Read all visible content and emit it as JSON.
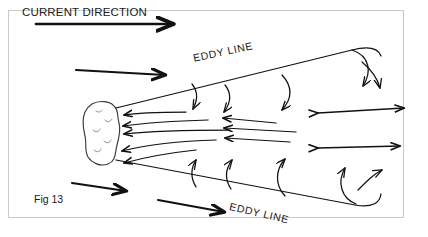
{
  "figure": {
    "width": 428,
    "height": 237,
    "background": "#ffffff",
    "frame_color": "#c9c9c9",
    "ink_color": "#111111",
    "title_label": "CURRENT DIRECTION",
    "figure_number": "Fig 13",
    "eddy_line_top_label": "EDDY LINE",
    "eddy_line_bottom_label": "EDDY LINE"
  },
  "elements": {
    "obstacle_name": "rock-obstacle",
    "eddy_line_top_name": "eddy-line-top",
    "eddy_line_bottom_name": "eddy-line-bottom",
    "downstream_arrows": "main-current-arrows",
    "return_flow_arrows": "eddy-return-flow-arrows",
    "recirculation_arrows": "eddy-recirculation-curved-arrows",
    "shear_arrows": "double-headed-shear-arrows"
  }
}
